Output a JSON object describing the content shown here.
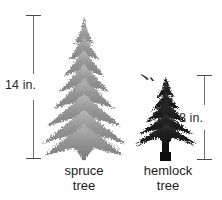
{
  "figure": {
    "width": 222,
    "height": 200,
    "background_color": "#ffffff"
  },
  "measurements": [
    {
      "id": "spruce-height",
      "label": "14 in.",
      "value": 14,
      "unit": "in.",
      "applies_to": "spruce tree",
      "bar_color": "#6f6f6f",
      "text_color": "#2b2b2b"
    },
    {
      "id": "hemlock-height",
      "label": "8 in.",
      "value": 8,
      "unit": "in.",
      "applies_to": "hemlock tree",
      "bar_color": "#6f6f6f",
      "text_color": "#2b2b2b"
    }
  ],
  "trees": [
    {
      "id": "spruce",
      "caption_line1": "spruce",
      "caption_line2": "tree",
      "height_label": "14 in.",
      "foliage_color": "#8e8e8e",
      "trunk_color": "#6b6b6b"
    },
    {
      "id": "hemlock",
      "caption_line1": "hemlock",
      "caption_line2": "tree",
      "height_label": "8 in.",
      "foliage_color": "#1f1f1f",
      "trunk_color": "#111111"
    }
  ]
}
